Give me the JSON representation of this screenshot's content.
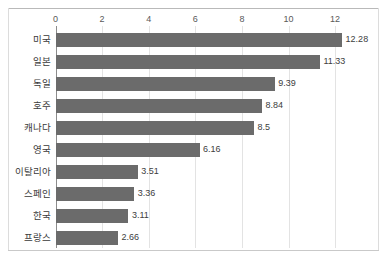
{
  "chart_data": {
    "type": "bar",
    "orientation": "horizontal",
    "title": "",
    "subtitle": "",
    "xlabel": "",
    "ylabel": "",
    "xlim": [
      0,
      12.8
    ],
    "xticks": [
      0,
      2,
      4,
      6,
      8,
      10,
      12
    ],
    "xtick_labels": [
      "0",
      "2",
      "4",
      "6",
      "8",
      "10",
      "12"
    ],
    "grid": "vertical",
    "legend": "none",
    "bar_color": "#6b6b6b",
    "categories": [
      "미국",
      "일본",
      "독일",
      "호주",
      "캐나다",
      "영국",
      "이탈리아",
      "스페인",
      "한국",
      "프랑스"
    ],
    "values": [
      12.28,
      11.33,
      9.39,
      8.84,
      8.5,
      6.16,
      3.51,
      3.36,
      3.11,
      2.66
    ],
    "value_labels": [
      "12.28",
      "11.33",
      "9.39",
      "8.84",
      "8.5",
      "6.16",
      "3.51",
      "3.36",
      "3.11",
      "2.66"
    ],
    "bars": [
      {
        "category": "미국",
        "value": 12.28,
        "label": "12.28"
      },
      {
        "category": "일본",
        "value": 11.33,
        "label": "11.33"
      },
      {
        "category": "독일",
        "value": 9.39,
        "label": "9.39"
      },
      {
        "category": "호주",
        "value": 8.84,
        "label": "8.84"
      },
      {
        "category": "캐나다",
        "value": 8.5,
        "label": "8.5"
      },
      {
        "category": "영국",
        "value": 6.16,
        "label": "6.16"
      },
      {
        "category": "이탈리아",
        "value": 3.51,
        "label": "3.51"
      },
      {
        "category": "스페인",
        "value": 3.36,
        "label": "3.36"
      },
      {
        "category": "한국",
        "value": 3.11,
        "label": "3.11"
      },
      {
        "category": "프랑스",
        "value": 2.66,
        "label": "2.66"
      }
    ]
  },
  "colors": {
    "bar": "#6b6b6b",
    "grid": "#e3e3e3",
    "axis": "#8c8c8c",
    "text": "#3a3a3a",
    "tick_text": "#595959",
    "frame": "#c9c9c9",
    "background": "#ffffff"
  }
}
